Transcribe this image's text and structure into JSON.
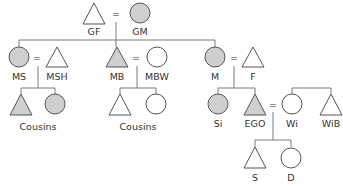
{
  "diagram": {
    "colors": {
      "filled": "#cfcfcf",
      "unfilled": "#ffffff",
      "stroke": "#555555",
      "line": "#7a7a7a",
      "text": "#333333"
    },
    "legend": {
      "triangle": "male",
      "circle": "female",
      "equals": "marriage",
      "shaded": "consanguineal relative of EGO"
    },
    "nodes": [
      {
        "id": "GF",
        "label": "GF",
        "shape": "triangle",
        "shaded": false
      },
      {
        "id": "GM",
        "label": "GM",
        "shape": "circle",
        "shaded": true
      },
      {
        "id": "MS",
        "label": "MS",
        "shape": "circle",
        "shaded": true
      },
      {
        "id": "MSH",
        "label": "MSH",
        "shape": "triangle",
        "shaded": false
      },
      {
        "id": "MB",
        "label": "MB",
        "shape": "triangle",
        "shaded": true
      },
      {
        "id": "MBW",
        "label": "MBW",
        "shape": "circle",
        "shaded": false
      },
      {
        "id": "M",
        "label": "M",
        "shape": "circle",
        "shaded": true
      },
      {
        "id": "F",
        "label": "F",
        "shape": "triangle",
        "shaded": false
      },
      {
        "id": "MSC1",
        "label": "",
        "shape": "triangle",
        "shaded": true
      },
      {
        "id": "MSC2",
        "label": "",
        "shape": "circle",
        "shaded": true
      },
      {
        "id": "MBC1",
        "label": "",
        "shape": "triangle",
        "shaded": false
      },
      {
        "id": "MBC2",
        "label": "",
        "shape": "circle",
        "shaded": false
      },
      {
        "id": "Si",
        "label": "Si",
        "shape": "circle",
        "shaded": true
      },
      {
        "id": "EGO",
        "label": "EGO",
        "shape": "triangle",
        "shaded": true
      },
      {
        "id": "Wi",
        "label": "Wi",
        "shape": "circle",
        "shaded": false
      },
      {
        "id": "WiB",
        "label": "WiB",
        "shape": "triangle",
        "shaded": false
      },
      {
        "id": "S",
        "label": "S",
        "shape": "triangle",
        "shaded": false
      },
      {
        "id": "D",
        "label": "D",
        "shape": "circle",
        "shaded": false
      }
    ],
    "group_labels": {
      "ms_cousins": "Cousins",
      "mb_cousins": "Cousins"
    },
    "marriages": [
      [
        "GF",
        "GM"
      ],
      [
        "MS",
        "MSH"
      ],
      [
        "MB",
        "MBW"
      ],
      [
        "M",
        "F"
      ],
      [
        "EGO",
        "Wi"
      ]
    ],
    "equals_sign": "="
  }
}
